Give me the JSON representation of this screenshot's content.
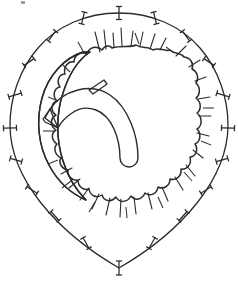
{
  "figure": {
    "title": "Anatomical cross-section line drawing",
    "caption": "",
    "background_color": "#ffffff",
    "outline_color": "#2b2b2b",
    "fill_color": "#c8c8c8",
    "inner_fill_color": "#ffffff",
    "width": 238,
    "height": 282
  },
  "structures": {
    "outer_capsule": {
      "label": "outer capsule contour",
      "stroke_width": 1.3,
      "path": "M 119 13 C 152 13 181 26 200 48 C 219 70 228 99 228 125 C 228 152 216 179 197 203 C 178 227 150 250 119 268 C 88 250 60 227 41 203 C 22 179 10 152 10 125 C 10 99 19 70 38 48 C 57 26 86 13 119 13 Z"
    },
    "gray_mass": {
      "label": "irregular gray mass",
      "stroke_width": 1.5,
      "path": "M 112 48 C 122 45 130 48 136 45 C 142 49 148 46 153 50 C 160 47 166 52 170 50 C 176 55 181 52 184 57 C 191 58 194 64 192 69 C 198 72 199 79 196 83 C 201 88 200 95 196 98 C 202 103 201 110 197 113 C 203 118 202 126 197 129 C 202 134 200 142 195 144 C 199 150 195 157 190 157 C 192 164 187 170 181 169 C 182 176 176 181 170 179 C 170 186 163 190 158 187 C 157 194 150 197 145 193 C 142 200 135 201 131 196 C 127 203 119 203 116 197 C 111 203 104 201 102 195 C 96 199 90 195 89 189 C 83 191 78 186 78 180 C 72 181 67 176 68 170 C 62 169 58 163 61 158 C 55 155 53 148 57 144 C 51 140 51 133 56 130 C 50 126 50 118 56 115 C 50 111 51 103 57 101 C 52 96 54 88 60 87 C 56 81 59 74 65 74 C 63 67 68 61 74 62 C 74 55 81 51 87 54 C 89 47 97 45 102 50 C 105 45 110 45 112 48 Z"
    },
    "white_crescent": {
      "label": "white crescent lip, left margin",
      "stroke_width": 1.4,
      "path": "M 83 52 C 64 58 48 76 42 98 C 36 120 38 145 49 165 C 58 182 72 194 86 200 C 77 191 68 177 63 161 C 56 139 56 114 63 93 C 69 74 78 60 90 52 Z"
    },
    "white_hook": {
      "label": "white hook structure, interior",
      "stroke_width": 1.4,
      "path": "M 50 109 C 56 100 66 93 78 90 C 90 87 101 89 110 95 C 119 101 126 111 131 123 C 136 135 138 147 138 158 C 138 163 134 167 129 167 C 124 167 120 163 120 158 C 120 148 118 138 114 129 C 110 120 104 113 96 110 C 88 107 79 108 72 113 C 66 117 61 122 58 128 L 45 118 Z"
    },
    "hook_stem": {
      "label": "hook stem projection",
      "stroke_width": 1.3,
      "path": "M 89 90 L 104 80 L 107 84 L 93 94 Z"
    },
    "hook_tip": {
      "label": "hook tapered tip",
      "stroke_width": 1.3,
      "path": "M 50 109 L 43 119 L 45 122 L 58 128 Z"
    }
  },
  "tick_marks": {
    "label": "perimeter tick marks",
    "count": 20,
    "items": [
      {
        "cx": 119,
        "cy": 13,
        "angle": 90,
        "len": 13
      },
      {
        "cx": 155,
        "cy": 18,
        "angle": 104,
        "len": 12
      },
      {
        "cx": 186,
        "cy": 36,
        "angle": 127,
        "len": 12
      },
      {
        "cx": 209,
        "cy": 62,
        "angle": 146,
        "len": 12
      },
      {
        "cx": 223,
        "cy": 95,
        "angle": 163,
        "len": 13
      },
      {
        "cx": 228,
        "cy": 128,
        "angle": 178,
        "len": 13
      },
      {
        "cx": 222,
        "cy": 160,
        "angle": 196,
        "len": 12
      },
      {
        "cx": 206,
        "cy": 190,
        "angle": 212,
        "len": 12
      },
      {
        "cx": 183,
        "cy": 216,
        "angle": 228,
        "len": 12
      },
      {
        "cx": 152,
        "cy": 243,
        "angle": 240,
        "len": 12
      },
      {
        "cx": 119,
        "cy": 268,
        "angle": 270,
        "len": 14
      },
      {
        "cx": 86,
        "cy": 243,
        "angle": 300,
        "len": 12
      },
      {
        "cx": 55,
        "cy": 216,
        "angle": 312,
        "len": 12
      },
      {
        "cx": 32,
        "cy": 190,
        "angle": 328,
        "len": 12
      },
      {
        "cx": 16,
        "cy": 160,
        "angle": 344,
        "len": 12
      },
      {
        "cx": 10,
        "cy": 128,
        "angle": 2,
        "len": 13
      },
      {
        "cx": 15,
        "cy": 95,
        "angle": 17,
        "len": 13
      },
      {
        "cx": 29,
        "cy": 62,
        "angle": 34,
        "len": 12
      },
      {
        "cx": 52,
        "cy": 36,
        "angle": 53,
        "len": 12
      },
      {
        "cx": 83,
        "cy": 18,
        "angle": 76,
        "len": 12
      }
    ]
  },
  "spikes": {
    "label": "radiating spike projections from gray mass",
    "count": 26,
    "items": [
      {
        "x1": 100,
        "y1": 52,
        "x2": 95,
        "y2": 32
      },
      {
        "x1": 106,
        "y1": 49,
        "x2": 104,
        "y2": 30
      },
      {
        "x1": 114,
        "y1": 47,
        "x2": 113,
        "y2": 33
      },
      {
        "x1": 122,
        "y1": 46,
        "x2": 121,
        "y2": 28
      },
      {
        "x1": 131,
        "y1": 46,
        "x2": 133,
        "y2": 31
      },
      {
        "x1": 140,
        "y1": 46,
        "x2": 143,
        "y2": 32
      },
      {
        "x1": 150,
        "y1": 49,
        "x2": 155,
        "y2": 34
      },
      {
        "x1": 160,
        "y1": 50,
        "x2": 166,
        "y2": 38
      },
      {
        "x1": 176,
        "y1": 56,
        "x2": 186,
        "y2": 46
      },
      {
        "x1": 189,
        "y1": 67,
        "x2": 200,
        "y2": 60
      },
      {
        "x1": 195,
        "y1": 81,
        "x2": 206,
        "y2": 77
      },
      {
        "x1": 198,
        "y1": 99,
        "x2": 210,
        "y2": 97
      },
      {
        "x1": 199,
        "y1": 116,
        "x2": 211,
        "y2": 116
      },
      {
        "x1": 197,
        "y1": 133,
        "x2": 209,
        "y2": 136
      },
      {
        "x1": 193,
        "y1": 150,
        "x2": 203,
        "y2": 158
      },
      {
        "x1": 186,
        "y1": 165,
        "x2": 195,
        "y2": 176
      },
      {
        "x1": 175,
        "y1": 177,
        "x2": 183,
        "y2": 190
      },
      {
        "x1": 162,
        "y1": 187,
        "x2": 168,
        "y2": 201
      },
      {
        "x1": 148,
        "y1": 193,
        "x2": 152,
        "y2": 209
      },
      {
        "x1": 134,
        "y1": 197,
        "x2": 136,
        "y2": 214
      },
      {
        "x1": 121,
        "y1": 199,
        "x2": 120,
        "y2": 217
      },
      {
        "x1": 110,
        "y1": 198,
        "x2": 106,
        "y2": 215
      },
      {
        "x1": 99,
        "y1": 194,
        "x2": 92,
        "y2": 209
      },
      {
        "x1": 89,
        "y1": 188,
        "x2": 80,
        "y2": 200
      },
      {
        "x1": 80,
        "y1": 179,
        "x2": 69,
        "y2": 188
      },
      {
        "x1": 72,
        "y1": 168,
        "x2": 61,
        "y2": 174
      }
    ]
  },
  "dashes": {
    "label": "short intermediate dash marks",
    "count": 14,
    "items": [
      {
        "x1": 78,
        "y1": 42,
        "x2": 83,
        "y2": 51
      },
      {
        "x1": 135,
        "y1": 33,
        "x2": 139,
        "y2": 44
      },
      {
        "x1": 166,
        "y1": 47,
        "x2": 174,
        "y2": 53
      },
      {
        "x1": 203,
        "y1": 108,
        "x2": 214,
        "y2": 108
      },
      {
        "x1": 201,
        "y1": 141,
        "x2": 211,
        "y2": 145
      },
      {
        "x1": 184,
        "y1": 172,
        "x2": 192,
        "y2": 181
      },
      {
        "x1": 158,
        "y1": 197,
        "x2": 163,
        "y2": 208
      },
      {
        "x1": 126,
        "y1": 207,
        "x2": 127,
        "y2": 218
      },
      {
        "x1": 95,
        "y1": 202,
        "x2": 89,
        "y2": 212
      },
      {
        "x1": 71,
        "y1": 181,
        "x2": 62,
        "y2": 188
      },
      {
        "x1": 58,
        "y1": 160,
        "x2": 48,
        "y2": 164
      },
      {
        "x1": 54,
        "y1": 131,
        "x2": 43,
        "y2": 131
      },
      {
        "x1": 58,
        "y1": 101,
        "x2": 48,
        "y2": 97
      },
      {
        "x1": 70,
        "y1": 72,
        "x2": 62,
        "y2": 64
      }
    ]
  }
}
